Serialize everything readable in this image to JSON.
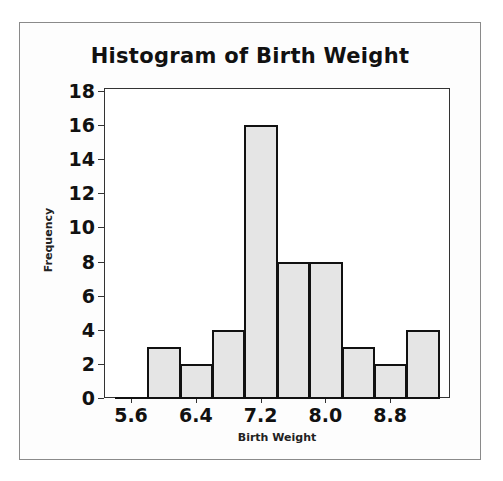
{
  "chart_data": {
    "type": "bar",
    "subtype": "histogram",
    "title": "Histogram of Birth Weight",
    "xlabel": "Birth Weight",
    "ylabel": "Frequency",
    "bin_width": 0.4,
    "bin_centers": [
      5.6,
      6.0,
      6.4,
      6.8,
      7.2,
      7.6,
      8.0,
      8.4,
      8.8,
      9.2
    ],
    "values": [
      0,
      3,
      2,
      4,
      16,
      8,
      8,
      3,
      2,
      4
    ],
    "xticks": [
      "5.6",
      "6.4",
      "7.2",
      "8.0",
      "8.8"
    ],
    "yticks": [
      "0",
      "2",
      "4",
      "6",
      "8",
      "10",
      "12",
      "14",
      "16",
      "18"
    ],
    "ylim": [
      0,
      18
    ],
    "grid": false,
    "legend": null,
    "colors": {
      "bar_fill": "#e5e5e5",
      "bar_edge": "#111111"
    }
  }
}
